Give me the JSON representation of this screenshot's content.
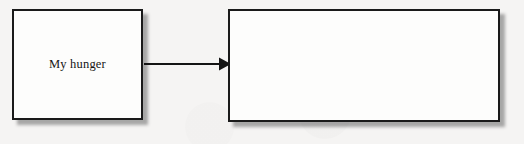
{
  "canvas": {
    "width": 524,
    "height": 144,
    "background_color": "#f4f4f3",
    "description": "Scanned textbook diagram: a labeled box connected by a right-pointing arrow to a second, blank box."
  },
  "diagram": {
    "type": "flow-diagram",
    "nodes": [
      {
        "id": "node-hunger",
        "label": "My hunger",
        "shape": "rectangle",
        "fill_color": "#fdfdfc",
        "border_color": "#1a1a1a",
        "shadow_color": "#3c3c3c",
        "x": 12,
        "y": 9,
        "width": 131,
        "height": 111
      },
      {
        "id": "node-empty",
        "label": "",
        "shape": "rectangle",
        "fill_color": "#fdfdfc",
        "border_color": "#1a1a1a",
        "shadow_color": "#3c3c3c",
        "x": 228,
        "y": 9,
        "width": 272,
        "height": 113
      }
    ],
    "connectors": [
      {
        "id": "arrow-hunger-to-empty",
        "from": "node-hunger",
        "to": "node-empty",
        "style": "solid",
        "direction": "right",
        "arrowhead": "filled-triangle",
        "color": "#141414",
        "label": ""
      }
    ]
  }
}
